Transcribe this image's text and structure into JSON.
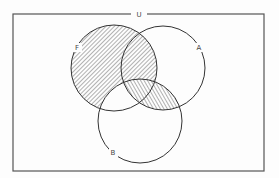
{
  "diagram": {
    "type": "venn",
    "universe": {
      "label": "U",
      "frame": {
        "x": 13,
        "y": 14,
        "width": 251,
        "height": 157
      }
    },
    "sets": [
      {
        "id": "F",
        "label": "F",
        "cx": 114,
        "cy": 68,
        "r": 43,
        "label_x": 77,
        "label_y": 50
      },
      {
        "id": "A",
        "label": "A",
        "cx": 163,
        "cy": 68,
        "r": 42,
        "label_x": 199,
        "label_y": 50
      },
      {
        "id": "B",
        "label": "B",
        "cx": 140,
        "cy": 121,
        "r": 42,
        "label_x": 113,
        "label_y": 155
      }
    ],
    "shaded_regions": [
      {
        "region": "F minus B",
        "hatch": "backslash"
      },
      {
        "region": "A intersect B",
        "hatch": "slash"
      }
    ],
    "colors": {
      "stroke": "#333333",
      "frame": "#555555",
      "hatch": "#555555",
      "background": "#fdfdfd"
    }
  }
}
